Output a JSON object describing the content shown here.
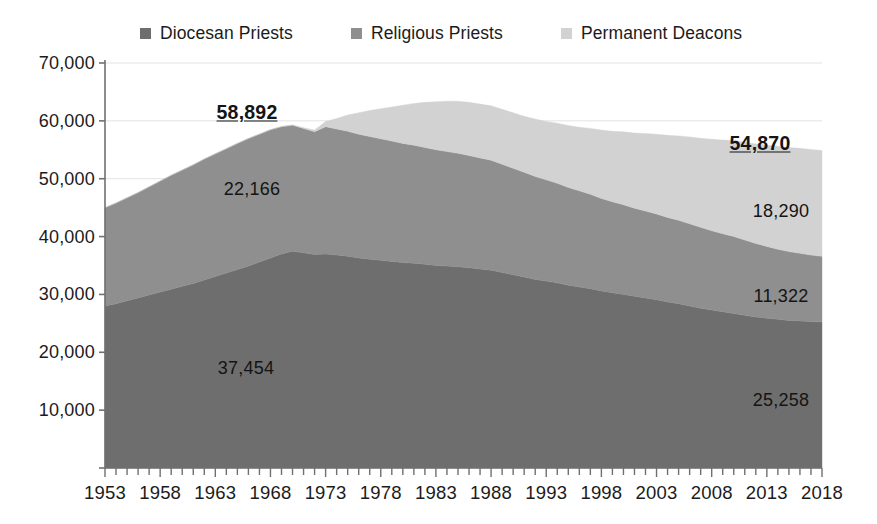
{
  "chart_data": {
    "type": "area",
    "stacked": true,
    "title": "",
    "xlabel": "",
    "ylabel": "",
    "xlim": [
      1953,
      2018
    ],
    "ylim": [
      0,
      70000
    ],
    "ytick_step": 10000,
    "grid": true,
    "grid_axis": "y",
    "legend_position": "top",
    "axis_tick_interval_years": 1,
    "axis_label_interval_years": 5,
    "ytick_labels": [
      "70,000",
      "60,000",
      "50,000",
      "40,000",
      "30,000",
      "20,000",
      "10,000"
    ],
    "ytick_values": [
      70000,
      60000,
      50000,
      40000,
      30000,
      20000,
      10000
    ],
    "xtick_labels": [
      "1953",
      "1958",
      "1963",
      "1968",
      "1973",
      "1978",
      "1983",
      "1988",
      "1993",
      "1998",
      "2003",
      "2008",
      "2013",
      "2018"
    ],
    "xtick_values": [
      1953,
      1958,
      1963,
      1968,
      1973,
      1978,
      1983,
      1988,
      1993,
      1998,
      2003,
      2008,
      2013,
      2018
    ],
    "x": [
      1953,
      1954,
      1955,
      1956,
      1957,
      1958,
      1959,
      1960,
      1961,
      1962,
      1963,
      1964,
      1965,
      1966,
      1967,
      1968,
      1969,
      1970,
      1971,
      1972,
      1973,
      1974,
      1975,
      1976,
      1977,
      1978,
      1979,
      1980,
      1981,
      1982,
      1983,
      1984,
      1985,
      1986,
      1987,
      1988,
      1989,
      1990,
      1991,
      1992,
      1993,
      1994,
      1995,
      1996,
      1997,
      1998,
      1999,
      2000,
      2001,
      2002,
      2003,
      2004,
      2005,
      2006,
      2007,
      2008,
      2009,
      2010,
      2011,
      2012,
      2013,
      2014,
      2015,
      2016,
      2017,
      2018
    ],
    "series": [
      {
        "name": "Diocesan Priests",
        "color": "#6e6e6e",
        "values": [
          28000,
          28400,
          28900,
          29400,
          29900,
          30400,
          30900,
          31400,
          31900,
          32500,
          33100,
          33700,
          34300,
          34900,
          35600,
          36300,
          37000,
          37454,
          37200,
          36900,
          37000,
          36800,
          36600,
          36300,
          36100,
          35900,
          35700,
          35500,
          35400,
          35200,
          35000,
          34900,
          34800,
          34600,
          34400,
          34200,
          33800,
          33400,
          33000,
          32600,
          32300,
          32000,
          31600,
          31300,
          31000,
          30600,
          30300,
          30000,
          29700,
          29400,
          29100,
          28700,
          28400,
          28000,
          27600,
          27300,
          27000,
          26700,
          26400,
          26100,
          25900,
          25700,
          25500,
          25400,
          25300,
          25258
        ]
      },
      {
        "name": "Religious Priests",
        "color": "#8f8f8f",
        "values": [
          17000,
          17400,
          17800,
          18200,
          18700,
          19200,
          19700,
          20100,
          20500,
          20900,
          21200,
          21500,
          21800,
          22050,
          22100,
          22166,
          22000,
          21800,
          21500,
          21200,
          22000,
          21800,
          21600,
          21400,
          21200,
          21000,
          20800,
          20600,
          20400,
          20200,
          20000,
          19800,
          19600,
          19400,
          19200,
          19000,
          18700,
          18400,
          18100,
          17800,
          17500,
          17200,
          16900,
          16600,
          16300,
          16000,
          15700,
          15500,
          15200,
          15000,
          14800,
          14600,
          14400,
          14200,
          14000,
          13700,
          13500,
          13300,
          13000,
          12700,
          12400,
          12100,
          11900,
          11700,
          11500,
          11322
        ]
      },
      {
        "name": "Permanent Deacons",
        "color": "#d2d2d2",
        "values": [
          0,
          0,
          0,
          0,
          0,
          0,
          0,
          0,
          0,
          0,
          0,
          0,
          0,
          0,
          0,
          0,
          0,
          0,
          100,
          300,
          900,
          1800,
          2800,
          3700,
          4500,
          5200,
          5900,
          6600,
          7200,
          7800,
          8300,
          8700,
          9000,
          9200,
          9300,
          9400,
          9500,
          9600,
          9700,
          9900,
          10100,
          10400,
          10700,
          11000,
          11400,
          11800,
          12200,
          12600,
          13000,
          13400,
          13800,
          14200,
          14600,
          15000,
          15400,
          15800,
          16200,
          16600,
          16900,
          17200,
          17500,
          17800,
          18000,
          18150,
          18250,
          18290
        ]
      }
    ],
    "annotations": [
      {
        "label": "58,892",
        "year": 1968,
        "value": 58892,
        "emphasis": "bold-underline",
        "series": "total",
        "px": 247,
        "py": 112
      },
      {
        "label": "22,166",
        "year": 1968,
        "value": 22166,
        "emphasis": "normal",
        "series": "Religious Priests",
        "px": 252,
        "py": 189
      },
      {
        "label": "37,454",
        "year": 1970,
        "value": 37454,
        "emphasis": "normal",
        "series": "Diocesan Priests",
        "px": 246,
        "py": 368
      },
      {
        "label": "54,870",
        "year": 2014,
        "value": 54870,
        "emphasis": "bold-underline",
        "series": "total",
        "px": 760,
        "py": 143
      },
      {
        "label": "18,290",
        "year": 2018,
        "value": 18290,
        "emphasis": "normal",
        "series": "Permanent Deacons",
        "px": 781,
        "py": 211
      },
      {
        "label": "11,322",
        "year": 2018,
        "value": 11322,
        "emphasis": "normal",
        "series": "Religious Priests",
        "px": 781,
        "py": 296
      },
      {
        "label": "25,258",
        "year": 2018,
        "value": 25258,
        "emphasis": "normal",
        "series": "Diocesan Priests",
        "px": 781,
        "py": 400
      }
    ]
  },
  "legend": {
    "items": [
      {
        "label": "Diocesan Priests",
        "color": "#6e6e6e",
        "icon": "square-marker-icon"
      },
      {
        "label": "Religious Priests",
        "color": "#8f8f8f",
        "icon": "square-marker-icon"
      },
      {
        "label": "Permanent Deacons",
        "color": "#d2d2d2",
        "icon": "square-marker-icon"
      }
    ]
  },
  "colors": {
    "diocesan": "#6e6e6e",
    "religious": "#8f8f8f",
    "deacons": "#d2d2d2",
    "axis": "#808080",
    "grid": "#e2e2e2",
    "text": "#1b1b1b",
    "background": "#ffffff"
  }
}
